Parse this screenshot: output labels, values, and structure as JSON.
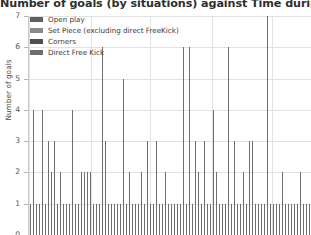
{
  "chart_data": {
    "type": "bar",
    "title": "Number of goals (by situations) against Time during match for",
    "xlabel": "",
    "ylabel": "Number of goals",
    "ylim": [
      0,
      7
    ],
    "yticks": [
      0,
      1,
      2,
      3,
      4,
      5,
      6,
      7
    ],
    "grid": true,
    "legend_position": "top-left",
    "stacked": true,
    "bar_color": "#6e6e6e",
    "gridline_color": "#e2e2e2",
    "axis_color": "#c8c8c8",
    "legend": [
      {
        "label": "Open play",
        "color": "#5f5f5f"
      },
      {
        "label": "Set Piece (excluding direct FreeKick)",
        "color": "#8a8a8a"
      },
      {
        "label": "Corners",
        "color": "#4f4f4f"
      },
      {
        "label": "Direct Free Kick",
        "color": "#6e6e6e"
      }
    ],
    "x": [
      1,
      2,
      3,
      4,
      5,
      6,
      7,
      8,
      9,
      10,
      11,
      12,
      13,
      14,
      15,
      16,
      17,
      18,
      19,
      20,
      21,
      22,
      23,
      24,
      25,
      26,
      27,
      28,
      29,
      30,
      31,
      32,
      33,
      34,
      35,
      36,
      37,
      38,
      39,
      40,
      41,
      42,
      43,
      44,
      45,
      46,
      47,
      48,
      49,
      50,
      51,
      52,
      53,
      54,
      55,
      56,
      57,
      58,
      59,
      60,
      61,
      62,
      63,
      64,
      65,
      66,
      67,
      68,
      69,
      70,
      71,
      72,
      73,
      74,
      75,
      76,
      77,
      78,
      79,
      80,
      81,
      82,
      83,
      84,
      85,
      86,
      87,
      88,
      89,
      90,
      91,
      92,
      93,
      94
    ],
    "values": [
      1,
      4,
      1,
      1,
      4,
      1,
      3,
      2,
      3,
      1,
      2,
      1,
      1,
      1,
      4,
      1,
      1,
      2,
      2,
      2,
      2,
      1,
      1,
      1,
      6,
      3,
      1,
      1,
      1,
      1,
      1,
      5,
      1,
      2,
      1,
      1,
      1,
      2,
      1,
      3,
      1,
      1,
      3,
      1,
      1,
      2,
      1,
      1,
      1,
      1,
      1,
      6,
      1,
      6,
      1,
      3,
      2,
      1,
      3,
      1,
      1,
      4,
      2,
      1,
      1,
      1,
      6,
      1,
      3,
      1,
      1,
      2,
      1,
      3,
      3,
      1,
      1,
      1,
      1,
      7,
      1,
      1,
      1,
      1,
      2,
      1,
      1,
      1,
      1,
      1,
      2,
      1,
      1,
      1
    ]
  }
}
